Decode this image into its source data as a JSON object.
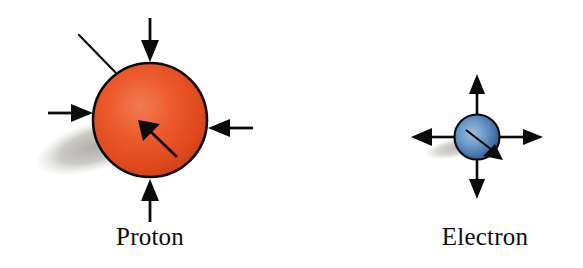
{
  "figure": {
    "title": "",
    "background_color": "#ffffff",
    "width": 583,
    "height": 268
  },
  "particles": [
    {
      "id": "proton",
      "label": "Proton",
      "charge_sign": "positive",
      "sphere": {
        "center_x": 150,
        "center_y": 120,
        "radius": 58,
        "fill_center_color": "#f0603a",
        "fill_edge_color": "#d23b16",
        "outline_color": "#0a0a0a",
        "outline_width": 2.6
      },
      "shadow": {
        "center_x": 96,
        "center_y": 146,
        "rx": 62,
        "ry": 24,
        "rotation_deg": -17,
        "color": "#b9b7b2"
      },
      "force_arrows_direction": "inward",
      "force_arrows": [
        {
          "name": "force-arrow-top",
          "from_x": 150,
          "from_y": 18,
          "to_x": 150,
          "to_y": 58
        },
        {
          "name": "force-arrow-left",
          "from_x": 48,
          "from_y": 113,
          "to_x": 91,
          "to_y": 113
        },
        {
          "name": "force-arrow-right",
          "from_x": 253,
          "from_y": 128,
          "to_x": 211,
          "to_y": 128
        },
        {
          "name": "force-arrow-bottom",
          "from_x": 150,
          "from_y": 222,
          "to_x": 150,
          "to_y": 181
        }
      ],
      "spin_arrow": {
        "name": "spin-arrow",
        "from_x": 177,
        "from_y": 157,
        "to_x": 141,
        "to_y": 122,
        "direction": "up-left"
      },
      "axis_line": {
        "name": "spin-axis-line",
        "from_x": 79,
        "from_y": 35,
        "to_x": 116,
        "to_y": 73
      },
      "label_position": {
        "x": 150,
        "y": 240
      }
    },
    {
      "id": "electron",
      "label": "Electron",
      "charge_sign": "negative",
      "sphere": {
        "center_x": 477,
        "center_y": 137,
        "radius": 23,
        "fill_center_color": "#7ba3cf",
        "fill_edge_color": "#1d4878",
        "outline_color": "#0a0a0a",
        "outline_width": 2.0
      },
      "shadow": {
        "center_x": 455,
        "center_y": 148,
        "rx": 30,
        "ry": 10,
        "rotation_deg": -12,
        "color": "#c6c4bf"
      },
      "force_arrows_direction": "outward",
      "force_arrows": [
        {
          "name": "force-arrow-top",
          "from_x": 477,
          "from_y": 116,
          "to_x": 477,
          "to_y": 74
        },
        {
          "name": "force-arrow-left",
          "from_x": 456,
          "from_y": 137,
          "to_x": 411,
          "to_y": 137
        },
        {
          "name": "force-arrow-right",
          "from_x": 498,
          "from_y": 137,
          "to_x": 543,
          "to_y": 137
        },
        {
          "name": "force-arrow-bottom",
          "from_x": 477,
          "from_y": 158,
          "to_x": 477,
          "to_y": 199
        }
      ],
      "spin_arrow": {
        "name": "spin-arrow",
        "from_x": 466,
        "from_y": 132,
        "to_x": 497,
        "to_y": 157,
        "direction": "down-right"
      },
      "axis_line": null,
      "label_position": {
        "x": 477,
        "y": 240
      }
    }
  ],
  "colors": {
    "proton_fill": "#e4491f",
    "electron_fill": "#3f6ea4",
    "arrow_color": "#0a0a0a",
    "shadow_color": "#bdbbb6",
    "label_color": "#0d0d0d",
    "background": "#ffffff"
  }
}
